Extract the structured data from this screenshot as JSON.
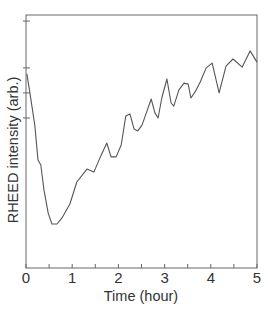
{
  "chart_data": {
    "type": "line",
    "title": "",
    "xlabel": "Time (hour)",
    "ylabel": "RHEED intensity (arb.)",
    "xlim": [
      0,
      5
    ],
    "ylim": [
      0,
      1
    ],
    "grid": false,
    "legend": null,
    "x_ticks": [
      0,
      1,
      2,
      3,
      4,
      5
    ],
    "x_tick_labels": [
      "0",
      "1",
      "2",
      "3",
      "4",
      "5"
    ],
    "x_minor_ticks": [
      0.5,
      1.5,
      2.5,
      3.5,
      4.5
    ],
    "y_ticks": [
      0.593,
      0.692,
      0.791,
      0.976
    ],
    "y_tick_labels": [],
    "series": [
      {
        "name": "RHEED intensity",
        "color": "#555555",
        "x": [
          0.02,
          0.09,
          0.19,
          0.26,
          0.32,
          0.39,
          0.48,
          0.56,
          0.67,
          0.78,
          0.95,
          1.1,
          1.32,
          1.47,
          1.62,
          1.75,
          1.84,
          1.95,
          2.06,
          2.16,
          2.25,
          2.34,
          2.42,
          2.51,
          2.64,
          2.71,
          2.79,
          2.86,
          2.94,
          3.05,
          3.14,
          3.2,
          3.31,
          3.42,
          3.51,
          3.57,
          3.66,
          3.77,
          3.9,
          4.03,
          4.18,
          4.33,
          4.48,
          4.68,
          4.85,
          5.0
        ],
        "y": [
          0.767,
          0.684,
          0.565,
          0.427,
          0.407,
          0.308,
          0.217,
          0.174,
          0.174,
          0.198,
          0.253,
          0.34,
          0.391,
          0.379,
          0.443,
          0.494,
          0.439,
          0.439,
          0.486,
          0.601,
          0.609,
          0.549,
          0.542,
          0.565,
          0.632,
          0.668,
          0.613,
          0.593,
          0.672,
          0.747,
          0.652,
          0.64,
          0.704,
          0.731,
          0.727,
          0.672,
          0.696,
          0.735,
          0.791,
          0.81,
          0.692,
          0.798,
          0.826,
          0.794,
          0.858,
          0.814
        ]
      }
    ]
  },
  "colors": {
    "axis": "#666666",
    "line": "#555555",
    "text": "#333333",
    "background": "#ffffff"
  }
}
